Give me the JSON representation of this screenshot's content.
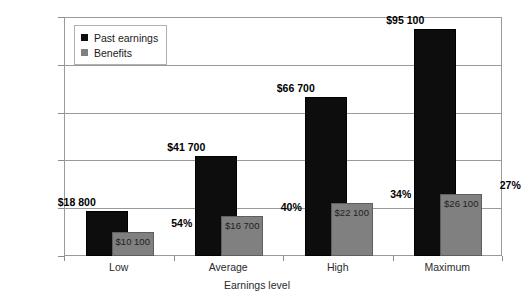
{
  "chart_data": {
    "type": "bar",
    "title": "",
    "xlabel": "Earnings level",
    "ylabel": "",
    "ylim": [
      0,
      100000
    ],
    "grid": true,
    "legend_position": "top-left-inside",
    "categories": [
      "Low",
      "Average",
      "High",
      "Maximum"
    ],
    "y_ticks": [
      {
        "value": 0,
        "label": "$0"
      },
      {
        "value": 20000,
        "label": "$20 000"
      },
      {
        "value": 40000,
        "label": "$40 000"
      },
      {
        "value": 60000,
        "label": "$60 000"
      },
      {
        "value": 80000,
        "label": "$80 000"
      },
      {
        "value": 100000,
        "label": "$100 000"
      }
    ],
    "series": [
      {
        "name": "Past earnings",
        "color": "#0d0d0d",
        "values": [
          18800,
          41700,
          66700,
          95100
        ],
        "value_labels": [
          "$18 800",
          "$41 700",
          "$66 700",
          "$95 100"
        ]
      },
      {
        "name": "Benefits",
        "color": "#808080",
        "values": [
          10100,
          16700,
          22100,
          26100
        ],
        "value_labels": [
          "$10 100",
          "$16 700",
          "$22 100",
          "$26 100"
        ]
      }
    ],
    "annotations": {
      "ratio_labels": [
        "54%",
        "40%",
        "34%",
        "27%"
      ]
    }
  },
  "legend": {
    "items": [
      {
        "label": "Past earnings",
        "swatch": "dark-square-swatch"
      },
      {
        "label": "Benefits",
        "swatch": "gray-square-swatch"
      }
    ]
  }
}
